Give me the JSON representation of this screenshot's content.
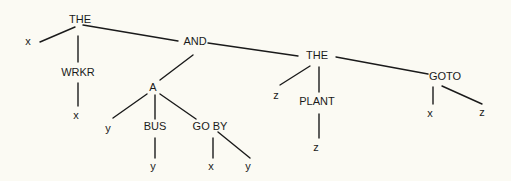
{
  "diagram": {
    "type": "tree",
    "background": "#fbfaf3",
    "line_color": "#1a1a1a",
    "nodes": [
      {
        "id": "the1",
        "label": "THE",
        "x": 80,
        "y": 20
      },
      {
        "id": "x1",
        "label": "x",
        "x": 28,
        "y": 42
      },
      {
        "id": "wrkr",
        "label": "WRKR",
        "x": 78,
        "y": 73
      },
      {
        "id": "x2",
        "label": "x",
        "x": 76,
        "y": 116
      },
      {
        "id": "and",
        "label": "AND",
        "x": 195,
        "y": 42
      },
      {
        "id": "a",
        "label": "A",
        "x": 153,
        "y": 88
      },
      {
        "id": "y1",
        "label": "y",
        "x": 108,
        "y": 129
      },
      {
        "id": "bus",
        "label": "BUS",
        "x": 155,
        "y": 127
      },
      {
        "id": "y2",
        "label": "y",
        "x": 153,
        "y": 167
      },
      {
        "id": "goby",
        "label": "GO BY",
        "x": 210,
        "y": 127
      },
      {
        "id": "x3",
        "label": "x",
        "x": 211,
        "y": 167
      },
      {
        "id": "y3",
        "label": "y",
        "x": 248,
        "y": 167
      },
      {
        "id": "the2",
        "label": "THE",
        "x": 317,
        "y": 56
      },
      {
        "id": "z1",
        "label": "z",
        "x": 276,
        "y": 96
      },
      {
        "id": "plant",
        "label": "PLANT",
        "x": 317,
        "y": 102
      },
      {
        "id": "z2",
        "label": "z",
        "x": 316,
        "y": 148
      },
      {
        "id": "goto",
        "label": "GOTO",
        "x": 445,
        "y": 77
      },
      {
        "id": "x4",
        "label": "x",
        "x": 430,
        "y": 114
      },
      {
        "id": "z3",
        "label": "z",
        "x": 482,
        "y": 113
      }
    ],
    "edges": [
      {
        "from": "the1",
        "to": "x1",
        "x1": 75,
        "y1": 27,
        "x2": 40,
        "y2": 42
      },
      {
        "from": "the1",
        "to": "wrkr",
        "x1": 78,
        "y1": 36,
        "x2": 78,
        "y2": 62
      },
      {
        "from": "wrkr",
        "to": "x2",
        "x1": 78,
        "y1": 83,
        "x2": 78,
        "y2": 106
      },
      {
        "from": "the1",
        "to": "and",
        "x1": 83,
        "y1": 25,
        "x2": 178,
        "y2": 41
      },
      {
        "from": "and",
        "to": "a",
        "x1": 193,
        "y1": 55,
        "x2": 160,
        "y2": 80
      },
      {
        "from": "and",
        "to": "the2",
        "x1": 208,
        "y1": 43,
        "x2": 298,
        "y2": 56
      },
      {
        "from": "a",
        "to": "y1",
        "x1": 147,
        "y1": 94,
        "x2": 113,
        "y2": 118
      },
      {
        "from": "a",
        "to": "bus",
        "x1": 155,
        "y1": 95,
        "x2": 155,
        "y2": 119
      },
      {
        "from": "a",
        "to": "goby",
        "x1": 160,
        "y1": 94,
        "x2": 196,
        "y2": 119
      },
      {
        "from": "bus",
        "to": "y2",
        "x1": 155,
        "y1": 138,
        "x2": 155,
        "y2": 158
      },
      {
        "from": "goby",
        "to": "x3",
        "x1": 213,
        "y1": 138,
        "x2": 213,
        "y2": 158
      },
      {
        "from": "goby",
        "to": "y3",
        "x1": 218,
        "y1": 132,
        "x2": 250,
        "y2": 158
      },
      {
        "from": "the2",
        "to": "z1",
        "x1": 310,
        "y1": 66,
        "x2": 280,
        "y2": 85
      },
      {
        "from": "the2",
        "to": "plant",
        "x1": 319,
        "y1": 67,
        "x2": 319,
        "y2": 92
      },
      {
        "from": "plant",
        "to": "z2",
        "x1": 319,
        "y1": 114,
        "x2": 319,
        "y2": 138
      },
      {
        "from": "the2",
        "to": "goto",
        "x1": 336,
        "y1": 57,
        "x2": 428,
        "y2": 74
      },
      {
        "from": "goto",
        "to": "x4",
        "x1": 433,
        "y1": 87,
        "x2": 433,
        "y2": 104
      },
      {
        "from": "goto",
        "to": "z3",
        "x1": 442,
        "y1": 86,
        "x2": 482,
        "y2": 104
      }
    ]
  }
}
